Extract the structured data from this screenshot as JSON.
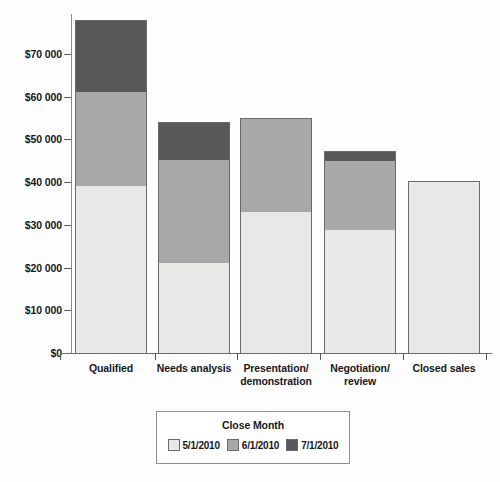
{
  "chart_data": {
    "type": "bar",
    "title": "",
    "subtitle": "",
    "stacked": true,
    "xlabel": "",
    "ylabel": "",
    "grid": false,
    "ylim": [
      0,
      79000
    ],
    "y_ticks": [
      0,
      10000,
      20000,
      30000,
      40000,
      50000,
      60000,
      70000
    ],
    "y_tick_labels": [
      "$0",
      "$10 000",
      "$20 000",
      "$30 000",
      "$40 000",
      "$50 000",
      "$60 000",
      "$70 000"
    ],
    "categories": [
      "Qualified",
      "Needs analysis",
      "Presentation/ demonstration",
      "Negotiation/ review",
      "Closed sales"
    ],
    "category_lines": [
      [
        "Qualified"
      ],
      [
        "Needs analysis"
      ],
      [
        "Presentation/",
        "demonstration"
      ],
      [
        "Negotiation/",
        "review"
      ],
      [
        "Closed sales"
      ]
    ],
    "legend": {
      "title": "Close Month",
      "position": "bottom",
      "entries": [
        "5/1/2010",
        "6/1/2010",
        "7/1/2010"
      ]
    },
    "series": [
      {
        "name": "5/1/2010",
        "color": "#e8e8e6",
        "values": [
          39400,
          21300,
          33300,
          29000,
          40300
        ]
      },
      {
        "name": "6/1/2010",
        "color": "#a8a8a8",
        "values": [
          22000,
          24100,
          21800,
          16200,
          0
        ]
      },
      {
        "name": "7/1/2010",
        "color": "#585858",
        "values": [
          16600,
          8700,
          0,
          2100,
          0
        ]
      }
    ],
    "totals": [
      78000,
      54100,
      55100,
      47300,
      40300
    ]
  },
  "colors": {
    "series_light": "#e8e8e6",
    "series_medium": "#a8a8a8",
    "series_dark": "#585858",
    "axis": "#6f6f6f",
    "text": "#18181a",
    "background": "#fdfdfd"
  }
}
